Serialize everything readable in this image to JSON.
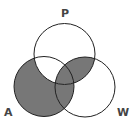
{
  "diagram": {
    "type": "venn-3",
    "sets": [
      {
        "label": "P",
        "cx": 64.5,
        "cy": 54,
        "r": 30.5
      },
      {
        "label": "A",
        "cx": 44,
        "cy": 86.5,
        "r": 30
      },
      {
        "label": "W",
        "cx": 85,
        "cy": 87,
        "r": 30
      }
    ],
    "shaded_regions": [
      "A only",
      "A∩W only",
      "A∩P∩W",
      "P∩W only"
    ],
    "unshaded_regions": [
      "P only",
      "A∩P only",
      "W only"
    ],
    "colors": {
      "shade": "#777777",
      "stroke": "#222222",
      "label": "#444444"
    },
    "labels": {
      "p": "P",
      "a": "A",
      "w": "W"
    }
  }
}
